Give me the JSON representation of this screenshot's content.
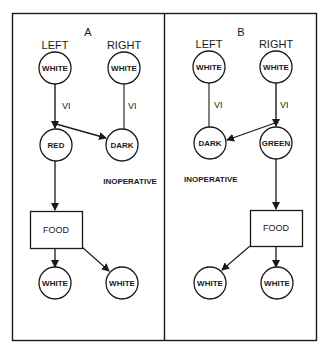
{
  "colors": {
    "ink": "#1a1a1a",
    "background": "#ffffff"
  },
  "panels": [
    {
      "label": "A",
      "top": {
        "left_label": "LEFT",
        "right_label": "RIGHT",
        "left_node": "WHITE",
        "right_node": "WHITE"
      },
      "edges": {
        "left_vi": "VI",
        "right_vi": "VI"
      },
      "middle": {
        "left_node": "RED",
        "right_node": "DARK"
      },
      "note": "INOPERATIVE",
      "box": "FOOD",
      "bottom": {
        "left_node": "WHITE",
        "right_node": "WHITE"
      }
    },
    {
      "label": "B",
      "top": {
        "left_label": "LEFT",
        "right_label": "RIGHT",
        "left_node": "WHITE",
        "right_node": "WHITE"
      },
      "edges": {
        "left_vi": "VI",
        "right_vi": "VI"
      },
      "middle": {
        "left_node": "DARK",
        "right_node": "GREEN"
      },
      "note": "INOPERATIVE",
      "box": "FOOD",
      "bottom": {
        "left_node": "WHITE",
        "right_node": "WHITE"
      }
    }
  ]
}
